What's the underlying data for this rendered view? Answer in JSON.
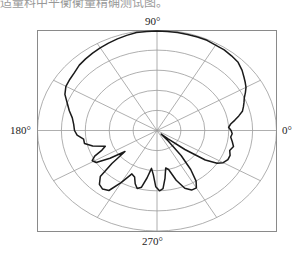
{
  "caption_fragment": "适量料中平衡衡量精确测试图。",
  "chart_data": {
    "type": "polar",
    "title": "",
    "angle_labels": [
      {
        "angle": 90,
        "text": "90°"
      },
      {
        "angle": 180,
        "text": "180°"
      },
      {
        "angle": 0,
        "text": "0°"
      },
      {
        "angle": 270,
        "text": "270°"
      }
    ],
    "rings": 5,
    "spokes_every_deg": 30,
    "radial_range": [
      0,
      1
    ],
    "grid": true,
    "frame": true,
    "series": [
      {
        "name": "radiation pattern",
        "color": "#1a1a1a",
        "points": [
          [
            0,
            0.62
          ],
          [
            3,
            0.6
          ],
          [
            6,
            0.62
          ],
          [
            9,
            0.66
          ],
          [
            12,
            0.7
          ],
          [
            15,
            0.74
          ],
          [
            18,
            0.76
          ],
          [
            21,
            0.78
          ],
          [
            24,
            0.8
          ],
          [
            27,
            0.83
          ],
          [
            30,
            0.86
          ],
          [
            33,
            0.88
          ],
          [
            36,
            0.9
          ],
          [
            40,
            0.93
          ],
          [
            45,
            0.96
          ],
          [
            50,
            0.97
          ],
          [
            55,
            0.98
          ],
          [
            60,
            0.98
          ],
          [
            65,
            0.99
          ],
          [
            70,
            0.99
          ],
          [
            75,
            0.99
          ],
          [
            80,
            0.99
          ],
          [
            85,
            0.99
          ],
          [
            90,
            0.99
          ],
          [
            95,
            0.99
          ],
          [
            100,
            0.99
          ],
          [
            105,
            0.98
          ],
          [
            110,
            0.97
          ],
          [
            115,
            0.96
          ],
          [
            120,
            0.95
          ],
          [
            125,
            0.94
          ],
          [
            130,
            0.93
          ],
          [
            135,
            0.92
          ],
          [
            140,
            0.9
          ],
          [
            145,
            0.89
          ],
          [
            150,
            0.88
          ],
          [
            155,
            0.85
          ],
          [
            160,
            0.8
          ],
          [
            165,
            0.76
          ],
          [
            170,
            0.72
          ],
          [
            175,
            0.7
          ],
          [
            180,
            0.69
          ],
          [
            184,
            0.67
          ],
          [
            188,
            0.62
          ],
          [
            192,
            0.62
          ],
          [
            196,
            0.56
          ],
          [
            200,
            0.46
          ],
          [
            203,
            0.5
          ],
          [
            206,
            0.58
          ],
          [
            209,
            0.62
          ],
          [
            212,
            0.6
          ],
          [
            215,
            0.48
          ],
          [
            218,
            0.34
          ],
          [
            221,
            0.5
          ],
          [
            224,
            0.66
          ],
          [
            228,
            0.72
          ],
          [
            232,
            0.74
          ],
          [
            236,
            0.72
          ],
          [
            240,
            0.6
          ],
          [
            244,
            0.48
          ],
          [
            248,
            0.5
          ],
          [
            251,
            0.56
          ],
          [
            254,
            0.6
          ],
          [
            257,
            0.58
          ],
          [
            260,
            0.48
          ],
          [
            263,
            0.38
          ],
          [
            266,
            0.44
          ],
          [
            269,
            0.56
          ],
          [
            272,
            0.6
          ],
          [
            275,
            0.58
          ],
          [
            278,
            0.48
          ],
          [
            281,
            0.38
          ],
          [
            284,
            0.4
          ],
          [
            288,
            0.52
          ],
          [
            292,
            0.62
          ],
          [
            296,
            0.66
          ],
          [
            300,
            0.66
          ],
          [
            303,
            0.6
          ],
          [
            306,
            0.48
          ],
          [
            309,
            0.32
          ],
          [
            312,
            0.14
          ],
          [
            315,
            0.05
          ],
          [
            318,
            0.12
          ],
          [
            321,
            0.3
          ],
          [
            324,
            0.5
          ],
          [
            327,
            0.6
          ],
          [
            330,
            0.64
          ],
          [
            334,
            0.66
          ],
          [
            338,
            0.66
          ],
          [
            342,
            0.64
          ],
          [
            346,
            0.66
          ],
          [
            350,
            0.64
          ],
          [
            354,
            0.62
          ],
          [
            357,
            0.63
          ],
          [
            360,
            0.62
          ]
        ]
      }
    ]
  }
}
